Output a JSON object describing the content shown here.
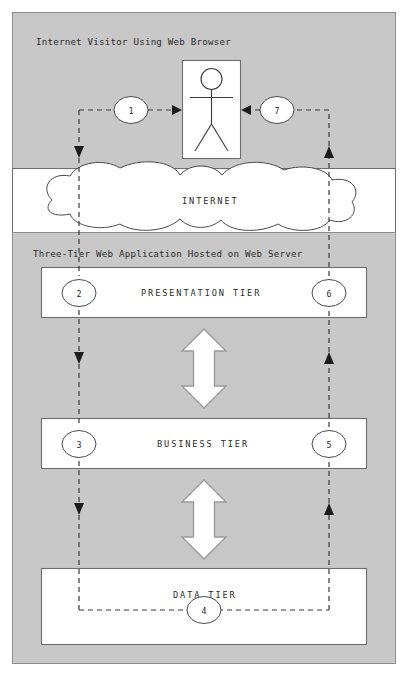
{
  "diagram": {
    "sections": [
      {
        "id": "visitor",
        "label": "Internet Visitor Using Web Browser"
      },
      {
        "id": "internet",
        "label": "INTERNET"
      },
      {
        "id": "server",
        "label": "Three-Tier Web Application Hosted on Web Server"
      }
    ],
    "actor": {
      "name": "web-browser-user",
      "shape": "stick-figure"
    },
    "cloud": {
      "label": "INTERNET"
    },
    "tiers": [
      {
        "id": "presentation",
        "label": "PRESENTATION TIER"
      },
      {
        "id": "business",
        "label": "BUSINESS TIER"
      },
      {
        "id": "data",
        "label": "DATA TIER"
      }
    ],
    "steps": [
      {
        "number": "1",
        "side": "left",
        "at": "visitor",
        "direction": "right"
      },
      {
        "number": "2",
        "side": "left",
        "at": "presentation",
        "direction": "down"
      },
      {
        "number": "3",
        "side": "left",
        "at": "business",
        "direction": "down"
      },
      {
        "number": "4",
        "side": "center",
        "at": "data",
        "direction": "right"
      },
      {
        "number": "5",
        "side": "right",
        "at": "business",
        "direction": "up"
      },
      {
        "number": "6",
        "side": "right",
        "at": "presentation",
        "direction": "up"
      },
      {
        "number": "7",
        "side": "right",
        "at": "visitor",
        "direction": "left"
      }
    ],
    "tier_connectors": [
      {
        "id": "presentation-business",
        "type": "double-headed-block-arrow"
      },
      {
        "id": "business-data",
        "type": "double-headed-block-arrow"
      }
    ],
    "colors": {
      "page_background": "#ffffff",
      "panel_gray": "#c8c8c8",
      "band_white": "#ffffff",
      "line_dark": "#3a3a3a",
      "box_stroke": "#6e6e6e",
      "arrow_stroke": "#9a9a9a",
      "text": "#2b2b2b"
    }
  }
}
